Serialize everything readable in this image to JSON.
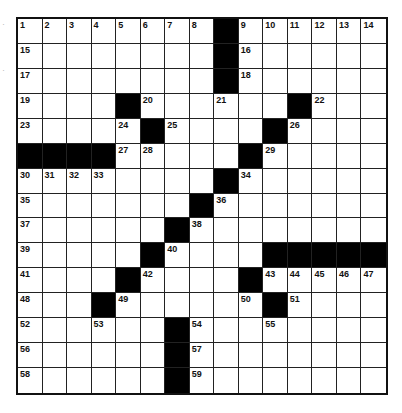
{
  "puzzle": {
    "rows": 15,
    "cols": 15,
    "colors": {
      "black": "#000000",
      "white": "#ffffff",
      "line": "#222222"
    },
    "grid": [
      [
        "1",
        "2",
        "3",
        "4",
        "5",
        "6",
        "7",
        "8",
        "#",
        "9",
        "10",
        "11",
        "12",
        "13",
        "14"
      ],
      [
        "15",
        "",
        "",
        "",
        "",
        "",
        "",
        "",
        "#",
        "16",
        "",
        "",
        "",
        "",
        ""
      ],
      [
        "17",
        "",
        "",
        "",
        "",
        "",
        "",
        "",
        "#",
        "18",
        "",
        "",
        "",
        "",
        ""
      ],
      [
        "19",
        "",
        "",
        "",
        "#",
        "20",
        "",
        "",
        "21",
        "",
        "",
        "#",
        "22",
        "",
        ""
      ],
      [
        "23",
        "",
        "",
        "",
        "24",
        "#",
        "25",
        "",
        "",
        "",
        "#",
        "26",
        "",
        "",
        ""
      ],
      [
        "#",
        "#",
        "#",
        "#",
        "27",
        "28",
        "",
        "",
        "",
        "#",
        "29",
        "",
        "",
        "",
        ""
      ],
      [
        "30",
        "31",
        "32",
        "33",
        "",
        "",
        "",
        "",
        "#",
        "34",
        "",
        "",
        "",
        "",
        ""
      ],
      [
        "35",
        "",
        "",
        "",
        "",
        "",
        "",
        "#",
        "36",
        "",
        "",
        "",
        "",
        "",
        ""
      ],
      [
        "37",
        "",
        "",
        "",
        "",
        "",
        "#",
        "38",
        "",
        "",
        "",
        "",
        "",
        "",
        ""
      ],
      [
        "39",
        "",
        "",
        "",
        "",
        "#",
        "40",
        "",
        "",
        "",
        "#",
        "#",
        "#",
        "#",
        "#"
      ],
      [
        "41",
        "",
        "",
        "",
        "#",
        "42",
        "",
        "",
        "",
        "#",
        "43",
        "44",
        "45",
        "46",
        "47"
      ],
      [
        "48",
        "",
        "",
        "#",
        "49",
        "",
        "",
        "",
        "",
        "50",
        "#",
        "51",
        "",
        "",
        ""
      ],
      [
        "52",
        "",
        "",
        "53",
        "",
        "",
        "#",
        "54",
        "",
        "",
        "55",
        "",
        "",
        "",
        ""
      ],
      [
        "56",
        "",
        "",
        "",
        "",
        "",
        "#",
        "57",
        "",
        "",
        "",
        "",
        "",
        "",
        ""
      ],
      [
        "58",
        "",
        "",
        "",
        "",
        "",
        "#",
        "59",
        "",
        "",
        "",
        "",
        "",
        "",
        ""
      ]
    ]
  }
}
